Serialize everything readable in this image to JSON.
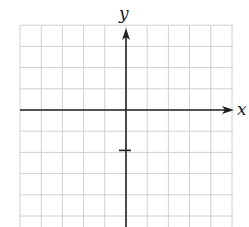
{
  "diagram": {
    "type": "coordinate-plane",
    "x_axis_label": "x",
    "y_axis_label": "y",
    "grid": {
      "x_range": [
        -5,
        5
      ],
      "y_range": [
        -5.5,
        4
      ],
      "step": 1
    },
    "marks": [
      {
        "kind": "tick",
        "axis": "y",
        "value": -2
      }
    ],
    "colors": {
      "grid": "#d0d0d0",
      "axis": "#222222",
      "background": "#ffffff"
    }
  }
}
